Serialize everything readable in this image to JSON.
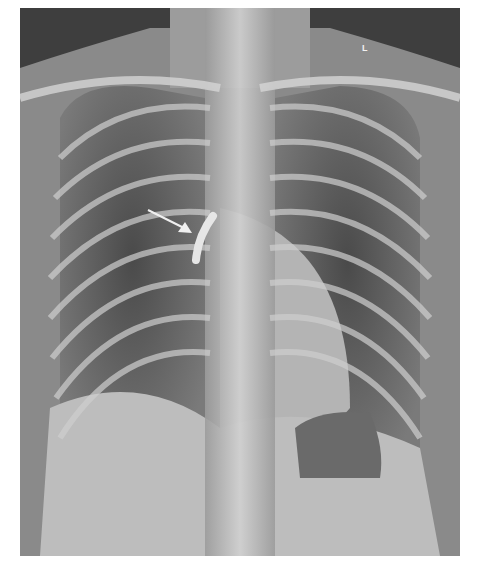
{
  "image": {
    "type": "chest radiograph (PA view)",
    "side_marker": "L",
    "annotation": {
      "kind": "arrow",
      "points_to": "tubular curved opacity right of midline in upper mediastinum",
      "color": "#f0f0f0"
    },
    "colors": {
      "background": "#ffffff",
      "film_dark": "#3c3c3c",
      "soft_tissue": "#8a8a8a",
      "bone": "#d8d8d8"
    }
  }
}
